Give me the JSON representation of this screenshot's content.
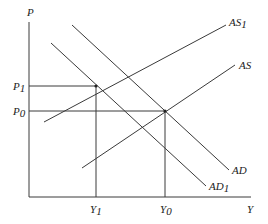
{
  "diagram": {
    "title": "",
    "axes": {
      "y_label": "P",
      "x_label": "Y"
    },
    "price_levels": [
      {
        "base": "P",
        "sub": "1"
      },
      {
        "base": "P",
        "sub": "0"
      }
    ],
    "output_levels": [
      {
        "base": "Y",
        "sub": "1"
      },
      {
        "base": "Y",
        "sub": "0"
      }
    ],
    "curves": [
      {
        "id": "AS1",
        "base": "AS",
        "sub": "1"
      },
      {
        "id": "AS",
        "base": "AS",
        "sub": ""
      },
      {
        "id": "AD",
        "base": "AD",
        "sub": ""
      },
      {
        "id": "AD1",
        "base": "AD",
        "sub": "1"
      }
    ],
    "equilibria": [
      {
        "label": "E1",
        "price": "P1",
        "output": "Y1"
      },
      {
        "label": "E0",
        "price": "P0",
        "output": "Y0"
      }
    ]
  }
}
